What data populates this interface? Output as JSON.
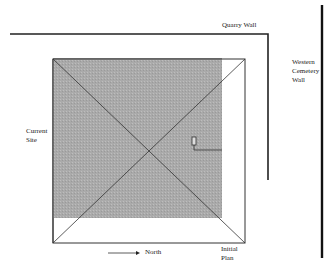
{
  "diagram": {
    "labels": {
      "quarry_wall": "Quarry Wall",
      "western_cemetery_wall_line1": "Western",
      "western_cemetery_wall_line2": "Cemetery",
      "western_cemetery_wall_line3": "Wall",
      "current_site_line1": "Current",
      "current_site_line2": "Site",
      "north": "North",
      "initial_plan_line1": "Initial",
      "initial_plan_line2": "Plan"
    },
    "colors": {
      "shade": "#a9a9a9",
      "line": "#222222",
      "background": "#ffffff"
    }
  }
}
